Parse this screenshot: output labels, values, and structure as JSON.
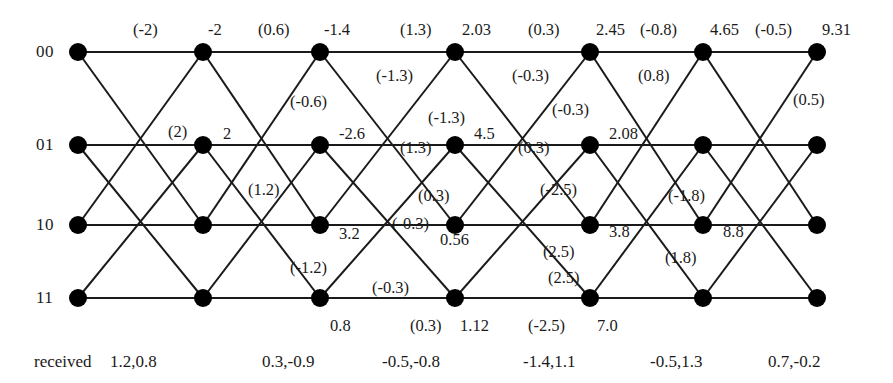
{
  "figure": {
    "type": "trellis-diagram",
    "title": "",
    "received_caption": "received"
  },
  "states": [
    {
      "label": "00",
      "y": 52
    },
    {
      "label": "01",
      "y": 145
    },
    {
      "label": "10",
      "y": 225
    },
    {
      "label": "11",
      "y": 298
    }
  ],
  "stage_x": [
    78,
    203,
    320,
    455,
    590,
    703,
    817
  ],
  "node_radius": 9,
  "colors": {
    "node": "#000000",
    "edge": "#1a1a1a",
    "text": "#1a1a1a",
    "background": "#ffffff"
  },
  "edges": [
    {
      "from": [
        0,
        0
      ],
      "to": [
        1,
        0
      ]
    },
    {
      "from": [
        0,
        0
      ],
      "to": [
        1,
        2
      ]
    },
    {
      "from": [
        0,
        1
      ],
      "to": [
        1,
        1
      ]
    },
    {
      "from": [
        0,
        1
      ],
      "to": [
        1,
        3
      ]
    },
    {
      "from": [
        0,
        2
      ],
      "to": [
        1,
        0
      ]
    },
    {
      "from": [
        0,
        2
      ],
      "to": [
        1,
        2
      ]
    },
    {
      "from": [
        0,
        3
      ],
      "to": [
        1,
        1
      ]
    },
    {
      "from": [
        0,
        3
      ],
      "to": [
        1,
        3
      ]
    },
    {
      "from": [
        1,
        0
      ],
      "to": [
        2,
        0
      ]
    },
    {
      "from": [
        1,
        0
      ],
      "to": [
        2,
        2
      ]
    },
    {
      "from": [
        1,
        1
      ],
      "to": [
        2,
        1
      ]
    },
    {
      "from": [
        1,
        1
      ],
      "to": [
        2,
        3
      ]
    },
    {
      "from": [
        1,
        2
      ],
      "to": [
        2,
        0
      ]
    },
    {
      "from": [
        1,
        2
      ],
      "to": [
        2,
        2
      ]
    },
    {
      "from": [
        1,
        3
      ],
      "to": [
        2,
        1
      ]
    },
    {
      "from": [
        1,
        3
      ],
      "to": [
        2,
        3
      ]
    },
    {
      "from": [
        2,
        0
      ],
      "to": [
        3,
        0
      ]
    },
    {
      "from": [
        2,
        0
      ],
      "to": [
        3,
        2
      ]
    },
    {
      "from": [
        2,
        1
      ],
      "to": [
        3,
        1
      ]
    },
    {
      "from": [
        2,
        1
      ],
      "to": [
        3,
        3
      ]
    },
    {
      "from": [
        2,
        2
      ],
      "to": [
        3,
        0
      ]
    },
    {
      "from": [
        2,
        2
      ],
      "to": [
        3,
        2
      ]
    },
    {
      "from": [
        2,
        3
      ],
      "to": [
        3,
        1
      ]
    },
    {
      "from": [
        2,
        3
      ],
      "to": [
        3,
        3
      ]
    },
    {
      "from": [
        3,
        0
      ],
      "to": [
        4,
        0
      ]
    },
    {
      "from": [
        3,
        0
      ],
      "to": [
        4,
        2
      ]
    },
    {
      "from": [
        3,
        1
      ],
      "to": [
        4,
        1
      ]
    },
    {
      "from": [
        3,
        1
      ],
      "to": [
        4,
        3
      ]
    },
    {
      "from": [
        3,
        2
      ],
      "to": [
        4,
        0
      ]
    },
    {
      "from": [
        3,
        2
      ],
      "to": [
        4,
        2
      ]
    },
    {
      "from": [
        3,
        3
      ],
      "to": [
        4,
        1
      ]
    },
    {
      "from": [
        3,
        3
      ],
      "to": [
        4,
        3
      ]
    },
    {
      "from": [
        4,
        0
      ],
      "to": [
        5,
        0
      ]
    },
    {
      "from": [
        4,
        0
      ],
      "to": [
        5,
        2
      ]
    },
    {
      "from": [
        4,
        1
      ],
      "to": [
        5,
        1
      ]
    },
    {
      "from": [
        4,
        1
      ],
      "to": [
        5,
        3
      ]
    },
    {
      "from": [
        4,
        2
      ],
      "to": [
        5,
        0
      ]
    },
    {
      "from": [
        4,
        2
      ],
      "to": [
        5,
        2
      ]
    },
    {
      "from": [
        4,
        3
      ],
      "to": [
        5,
        1
      ]
    },
    {
      "from": [
        4,
        3
      ],
      "to": [
        5,
        3
      ]
    },
    {
      "from": [
        5,
        0
      ],
      "to": [
        6,
        0
      ]
    },
    {
      "from": [
        5,
        0
      ],
      "to": [
        6,
        2
      ]
    },
    {
      "from": [
        5,
        1
      ],
      "to": [
        6,
        1
      ]
    },
    {
      "from": [
        5,
        1
      ],
      "to": [
        6,
        3
      ]
    },
    {
      "from": [
        5,
        2
      ],
      "to": [
        6,
        0
      ]
    },
    {
      "from": [
        5,
        2
      ],
      "to": [
        6,
        2
      ]
    },
    {
      "from": [
        5,
        3
      ],
      "to": [
        6,
        1
      ]
    },
    {
      "from": [
        5,
        3
      ],
      "to": [
        6,
        3
      ]
    }
  ],
  "path_metrics": [
    {
      "text": "-2",
      "x": 208,
      "y": 20
    },
    {
      "text": "-1.4",
      "x": 324,
      "y": 20
    },
    {
      "text": "2.03",
      "x": 462,
      "y": 20
    },
    {
      "text": "2.45",
      "x": 596,
      "y": 20
    },
    {
      "text": "4.65",
      "x": 710,
      "y": 20
    },
    {
      "text": "9.31",
      "x": 822,
      "y": 20
    },
    {
      "text": "2",
      "x": 223,
      "y": 124
    },
    {
      "text": "-2.6",
      "x": 339,
      "y": 124
    },
    {
      "text": "4.5",
      "x": 474,
      "y": 124
    },
    {
      "text": "2.08",
      "x": 609,
      "y": 124
    },
    {
      "text": "3.2",
      "x": 339,
      "y": 224
    },
    {
      "text": "0.56",
      "x": 440,
      "y": 230
    },
    {
      "text": "3.8",
      "x": 609,
      "y": 222
    },
    {
      "text": "8.8",
      "x": 723,
      "y": 222
    },
    {
      "text": "0.8",
      "x": 330,
      "y": 316
    },
    {
      "text": "1.12",
      "x": 460,
      "y": 316
    },
    {
      "text": "7.0",
      "x": 597,
      "y": 316
    }
  ],
  "branch_metrics": [
    {
      "text": "(-2)",
      "x": 133,
      "y": 20
    },
    {
      "text": "(0.6)",
      "x": 258,
      "y": 20
    },
    {
      "text": "(1.3)",
      "x": 400,
      "y": 20
    },
    {
      "text": "(0.3)",
      "x": 528,
      "y": 20
    },
    {
      "text": "(-0.8)",
      "x": 640,
      "y": 20
    },
    {
      "text": "(-0.5)",
      "x": 755,
      "y": 20
    },
    {
      "text": "(-1.3)",
      "x": 376,
      "y": 66
    },
    {
      "text": "(-0.3)",
      "x": 512,
      "y": 66
    },
    {
      "text": "(0.8)",
      "x": 638,
      "y": 66
    },
    {
      "text": "(0.5)",
      "x": 793,
      "y": 90
    },
    {
      "text": "(2)",
      "x": 168,
      "y": 122
    },
    {
      "text": "(-0.6)",
      "x": 290,
      "y": 92
    },
    {
      "text": "(-1.3)",
      "x": 428,
      "y": 108
    },
    {
      "text": "(-0.3)",
      "x": 552,
      "y": 100
    },
    {
      "text": "(1.3)",
      "x": 400,
      "y": 138
    },
    {
      "text": "(0.3)",
      "x": 518,
      "y": 138
    },
    {
      "text": "(1.2)",
      "x": 248,
      "y": 180
    },
    {
      "text": "(0.3)",
      "x": 418,
      "y": 186
    },
    {
      "text": "(-2.5)",
      "x": 540,
      "y": 180
    },
    {
      "text": "(-1.8)",
      "x": 668,
      "y": 186
    },
    {
      "text": "(-0.3)",
      "x": 392,
      "y": 214
    },
    {
      "text": "(-1.2)",
      "x": 290,
      "y": 258
    },
    {
      "text": "(2.5)",
      "x": 543,
      "y": 242
    },
    {
      "text": "(1.8)",
      "x": 665,
      "y": 248
    },
    {
      "text": "(-0.3)",
      "x": 372,
      "y": 278
    },
    {
      "text": "(2.5)",
      "x": 548,
      "y": 268
    },
    {
      "text": "(0.3)",
      "x": 410,
      "y": 316
    },
    {
      "text": "(-2.5)",
      "x": 528,
      "y": 316
    }
  ],
  "received_values": [
    {
      "text": "1.2,0.8",
      "x": 110,
      "y": 352
    },
    {
      "text": "0.3,-0.9",
      "x": 262,
      "y": 352
    },
    {
      "text": "-0.5,-0.8",
      "x": 382,
      "y": 352
    },
    {
      "text": "-1.4,1.1",
      "x": 523,
      "y": 352
    },
    {
      "text": "-0.5,1.3",
      "x": 650,
      "y": 352
    },
    {
      "text": "0.7,-0.2",
      "x": 768,
      "y": 352
    }
  ]
}
